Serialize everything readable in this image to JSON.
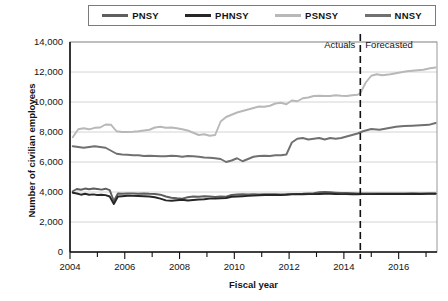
{
  "chart_data": {
    "type": "line",
    "title": "",
    "xlabel": "Fiscal year",
    "ylabel": "Number of civilian employees",
    "xlim": [
      2004,
      2017.4
    ],
    "ylim": [
      0,
      14000
    ],
    "grid": true,
    "legend_position": "top",
    "ytick_labels": [
      "0",
      "2,000",
      "4,000",
      "6,000",
      "8,000",
      "10,000",
      "12,000",
      "14,000"
    ],
    "ytick_values": [
      0,
      2000,
      4000,
      6000,
      8000,
      10000,
      12000,
      14000
    ],
    "xtick_labels": [
      "2004",
      "2006",
      "2008",
      "2010",
      "2012",
      "2014",
      "2016"
    ],
    "xtick_values": [
      2004,
      2006,
      2008,
      2010,
      2012,
      2014,
      2016
    ],
    "xminor_ticks": [
      2005,
      2007,
      2009,
      2011,
      2013,
      2015,
      2017
    ],
    "annotations": [
      {
        "name": "actuals-label",
        "text": "Actuals",
        "x": 2014.3,
        "y": 13100
      },
      {
        "name": "forecasted-label",
        "text": "Forecasted",
        "x": 2014.75,
        "y": 13100
      },
      {
        "name": "forecast-divider",
        "text": "",
        "x": 2014.6,
        "y": 0,
        "style": "dashed-vertical"
      }
    ],
    "forecast_start": 2014.6,
    "series": [
      {
        "name": "PNSY",
        "color": "#5e5e5e",
        "x": [
          2004.1,
          2004.25,
          2004.4,
          2004.55,
          2004.7,
          2004.85,
          2005.0,
          2005.15,
          2005.3,
          2005.45,
          2005.6,
          2005.75,
          2005.9,
          2006.1,
          2006.3,
          2006.5,
          2006.7,
          2006.9,
          2007.1,
          2007.3,
          2007.5,
          2007.7,
          2007.9,
          2008.1,
          2008.3,
          2008.5,
          2008.7,
          2008.9,
          2009.1,
          2009.3,
          2009.5,
          2009.7,
          2009.9,
          2010.1,
          2010.3,
          2010.5,
          2010.7,
          2010.9,
          2011.1,
          2011.3,
          2011.5,
          2011.7,
          2011.9,
          2012.1,
          2012.3,
          2012.5,
          2012.7,
          2012.9,
          2013.1,
          2013.3,
          2013.5,
          2013.7,
          2013.9,
          2014.1,
          2014.3,
          2014.5,
          2014.7,
          2015.0,
          2015.3,
          2015.6,
          2015.9,
          2016.2,
          2016.5,
          2016.8,
          2017.1,
          2017.35
        ],
        "values": [
          4050,
          4200,
          4150,
          4230,
          4180,
          4230,
          4200,
          4160,
          4220,
          4120,
          3400,
          3900,
          3880,
          3900,
          3900,
          3880,
          3900,
          3880,
          3870,
          3820,
          3700,
          3620,
          3580,
          3560,
          3650,
          3700,
          3680,
          3720,
          3700,
          3670,
          3700,
          3690,
          3800,
          3830,
          3850,
          3830,
          3860,
          3840,
          3850,
          3850,
          3860,
          3840,
          3850,
          3870,
          3870,
          3880,
          3900,
          3920,
          3980,
          4000,
          3980,
          3960,
          3940,
          3930,
          3920,
          3900,
          3900,
          3900,
          3900,
          3900,
          3910,
          3900,
          3910,
          3900,
          3905,
          3900
        ]
      },
      {
        "name": "PHNSY",
        "color": "#262626",
        "x": [
          2004.1,
          2004.25,
          2004.4,
          2004.55,
          2004.7,
          2004.85,
          2005.0,
          2005.15,
          2005.3,
          2005.45,
          2005.6,
          2005.75,
          2005.9,
          2006.1,
          2006.3,
          2006.5,
          2006.7,
          2006.9,
          2007.1,
          2007.3,
          2007.5,
          2007.7,
          2007.9,
          2008.1,
          2008.3,
          2008.5,
          2008.7,
          2008.9,
          2009.1,
          2009.3,
          2009.5,
          2009.7,
          2009.9,
          2010.1,
          2010.3,
          2010.5,
          2010.7,
          2010.9,
          2011.1,
          2011.3,
          2011.5,
          2011.7,
          2011.9,
          2012.1,
          2012.3,
          2012.5,
          2012.7,
          2012.9,
          2013.1,
          2013.3,
          2013.5,
          2013.7,
          2013.9,
          2014.1,
          2014.3,
          2014.5,
          2014.7,
          2015.0,
          2015.3,
          2015.6,
          2015.9,
          2016.2,
          2016.5,
          2016.8,
          2017.1,
          2017.35
        ],
        "values": [
          3950,
          3900,
          3820,
          3880,
          3820,
          3840,
          3800,
          3820,
          3790,
          3700,
          3200,
          3700,
          3720,
          3750,
          3740,
          3730,
          3720,
          3700,
          3650,
          3560,
          3440,
          3420,
          3450,
          3480,
          3430,
          3470,
          3500,
          3520,
          3560,
          3560,
          3580,
          3600,
          3680,
          3700,
          3720,
          3740,
          3760,
          3780,
          3800,
          3800,
          3810,
          3800,
          3820,
          3840,
          3850,
          3850,
          3860,
          3860,
          3870,
          3880,
          3880,
          3870,
          3860,
          3860,
          3850,
          3850,
          3860,
          3860,
          3870,
          3870,
          3870,
          3870,
          3880,
          3870,
          3880,
          3880
        ]
      },
      {
        "name": "PSNSY",
        "color": "#b8b8b8",
        "x": [
          2004.1,
          2004.3,
          2004.5,
          2004.7,
          2004.9,
          2005.1,
          2005.3,
          2005.5,
          2005.7,
          2005.9,
          2006.1,
          2006.3,
          2006.5,
          2006.7,
          2006.9,
          2007.1,
          2007.3,
          2007.5,
          2007.7,
          2007.9,
          2008.1,
          2008.3,
          2008.5,
          2008.7,
          2008.9,
          2009.1,
          2009.3,
          2009.5,
          2009.7,
          2009.9,
          2010.1,
          2010.3,
          2010.5,
          2010.7,
          2010.9,
          2011.1,
          2011.3,
          2011.5,
          2011.7,
          2011.9,
          2012.1,
          2012.3,
          2012.5,
          2012.7,
          2012.9,
          2013.1,
          2013.3,
          2013.5,
          2013.7,
          2013.9,
          2014.1,
          2014.3,
          2014.5,
          2014.6,
          2014.8,
          2015.0,
          2015.2,
          2015.4,
          2015.7,
          2016.0,
          2016.3,
          2016.6,
          2016.9,
          2017.15,
          2017.35
        ],
        "values": [
          7650,
          8180,
          8250,
          8180,
          8280,
          8300,
          8500,
          8480,
          8050,
          8000,
          8000,
          8020,
          8050,
          8100,
          8150,
          8300,
          8350,
          8280,
          8300,
          8250,
          8180,
          8100,
          7950,
          7800,
          7850,
          7750,
          7800,
          8700,
          9000,
          9150,
          9300,
          9400,
          9500,
          9600,
          9700,
          9680,
          9750,
          9900,
          9950,
          9850,
          10100,
          10050,
          10250,
          10300,
          10400,
          10420,
          10400,
          10400,
          10450,
          10420,
          10400,
          10450,
          10480,
          10600,
          11300,
          11750,
          11850,
          11780,
          11850,
          11950,
          12050,
          12100,
          12150,
          12250,
          12300
        ]
      },
      {
        "name": "NNSY",
        "color": "#707070",
        "x": [
          2004.1,
          2004.3,
          2004.5,
          2004.7,
          2004.9,
          2005.1,
          2005.3,
          2005.5,
          2005.7,
          2005.9,
          2006.1,
          2006.3,
          2006.5,
          2006.7,
          2006.9,
          2007.1,
          2007.3,
          2007.5,
          2007.7,
          2007.9,
          2008.1,
          2008.3,
          2008.5,
          2008.7,
          2008.9,
          2009.1,
          2009.3,
          2009.5,
          2009.7,
          2009.9,
          2010.1,
          2010.3,
          2010.5,
          2010.7,
          2010.9,
          2011.1,
          2011.3,
          2011.5,
          2011.7,
          2011.9,
          2012.1,
          2012.3,
          2012.5,
          2012.7,
          2012.9,
          2013.1,
          2013.3,
          2013.5,
          2013.7,
          2013.9,
          2014.1,
          2014.3,
          2014.5,
          2014.7,
          2015.0,
          2015.3,
          2015.6,
          2015.9,
          2016.2,
          2016.5,
          2016.8,
          2017.1,
          2017.35
        ],
        "values": [
          7050,
          7000,
          6950,
          7000,
          7050,
          7000,
          6950,
          6750,
          6550,
          6500,
          6480,
          6450,
          6450,
          6400,
          6420,
          6400,
          6380,
          6380,
          6420,
          6400,
          6350,
          6400,
          6380,
          6350,
          6300,
          6280,
          6250,
          6200,
          6000,
          6100,
          6250,
          6050,
          6200,
          6350,
          6400,
          6420,
          6400,
          6450,
          6450,
          6500,
          7300,
          7550,
          7600,
          7500,
          7550,
          7600,
          7500,
          7600,
          7550,
          7600,
          7700,
          7800,
          7900,
          8050,
          8200,
          8150,
          8250,
          8350,
          8400,
          8420,
          8450,
          8480,
          8600
        ]
      }
    ]
  }
}
